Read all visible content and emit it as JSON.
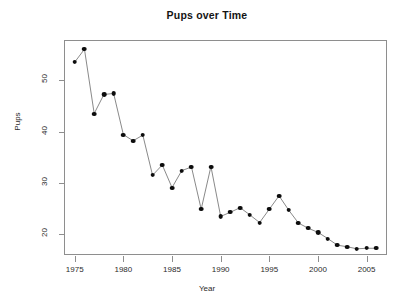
{
  "chart_data": {
    "type": "line",
    "title": "Pups over Time",
    "xlabel": "Year",
    "ylabel": "Pups",
    "grid": false,
    "legend": null,
    "marker": "filled-circle",
    "line_style": "solid-thin",
    "xlim": [
      1974.0,
      2007.2
    ],
    "ylim": [
      15.8,
      57.6
    ],
    "xticks": [
      1975,
      1980,
      1985,
      1990,
      1995,
      2000,
      2005
    ],
    "xtick_labels": [
      "1975",
      "1980",
      "1985",
      "1990",
      "1995",
      "2000",
      "2005"
    ],
    "yticks": [
      20,
      30,
      40,
      50
    ],
    "ytick_labels": [
      "20",
      "30",
      "40",
      "50"
    ],
    "x": [
      1975,
      1976,
      1977,
      1978,
      1979,
      1980,
      1981,
      1982,
      1983,
      1984,
      1985,
      1986,
      1987,
      1988,
      1989,
      1990,
      1991,
      1992,
      1993,
      1994,
      1995,
      1996,
      1997,
      1998,
      1999,
      2000,
      2001,
      2002,
      2003,
      2004,
      2005,
      2006
    ],
    "values": [
      53.5,
      56.0,
      43.5,
      47.2,
      47.4,
      39.4,
      38.2,
      39.3,
      31.5,
      33.5,
      29.1,
      32.4,
      33.1,
      24.9,
      33.2,
      23.5,
      24.3,
      25.2,
      23.8,
      22.3,
      24.9,
      27.5,
      24.7,
      22.2,
      21.2,
      20.4,
      19.2,
      17.9,
      17.6,
      17.2,
      17.3,
      17.3
    ],
    "series": [
      {
        "name": "Pups",
        "values": [
          53.5,
          56.0,
          43.5,
          47.2,
          47.4,
          39.4,
          38.2,
          39.3,
          31.5,
          33.5,
          29.1,
          32.4,
          33.1,
          24.9,
          33.2,
          23.5,
          24.3,
          25.2,
          23.8,
          22.3,
          24.9,
          27.5,
          24.7,
          22.2,
          21.2,
          20.4,
          19.2,
          17.9,
          17.6,
          17.2,
          17.3,
          17.3
        ],
        "color": "#0d0d0d"
      }
    ],
    "colors": {
      "marker": "#0d0d0d",
      "line": "#6b6b6b",
      "axis": "#8e8e8e",
      "text": "#2b2b2b",
      "title": "#141414",
      "background": "#ffffff"
    }
  }
}
